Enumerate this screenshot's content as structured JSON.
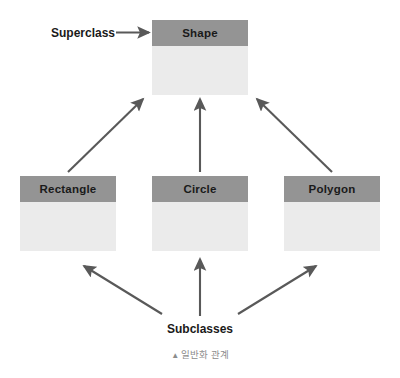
{
  "diagram": {
    "type": "uml-generalization",
    "caption": {
      "marker": "▲",
      "text": "일반화 관계"
    },
    "colors": {
      "header_fill": "#949494",
      "body_fill": "#ebebeb",
      "connector": "#595959",
      "text": "#1a1a1a",
      "caption_text": "#8c8c8c",
      "background": "#ffffff"
    },
    "annotations": [
      {
        "id": "superclass",
        "label": "Superclass"
      },
      {
        "id": "subclasses",
        "label": "Subclasses"
      }
    ],
    "classes": [
      {
        "id": "shape",
        "name": "Shape",
        "role": "superclass"
      },
      {
        "id": "rectangle",
        "name": "Rectangle",
        "role": "subclass"
      },
      {
        "id": "circle",
        "name": "Circle",
        "role": "subclass"
      },
      {
        "id": "polygon",
        "name": "Polygon",
        "role": "subclass"
      }
    ],
    "generalizations": [
      {
        "from": "Rectangle",
        "to": "Shape"
      },
      {
        "from": "Circle",
        "to": "Shape"
      },
      {
        "from": "Polygon",
        "to": "Shape"
      }
    ]
  }
}
